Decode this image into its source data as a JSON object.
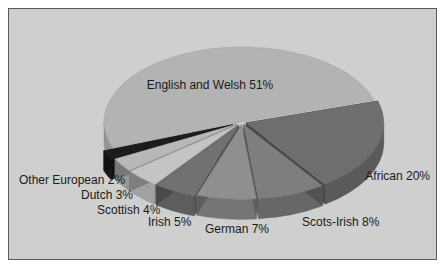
{
  "chart_data": {
    "type": "pie",
    "style": "3d-exploded",
    "title": "",
    "labels": [
      "English and Welsh",
      "African",
      "Scots-Irish",
      "German",
      "Irish",
      "Scottish",
      "Dutch",
      "Other European"
    ],
    "values": [
      51,
      20,
      8,
      7,
      5,
      4,
      3,
      2
    ],
    "display_labels": [
      "English and Welsh 51%",
      "African 20%",
      "Scots-Irish 8%",
      "German 7%",
      "Irish 5%",
      "Scottish 4%",
      "Dutch 3%",
      "Other European 2%"
    ],
    "units": "%",
    "legend": "none (direct labels)",
    "colors": [
      "#b3b3b3",
      "#6e6e6e",
      "#7e7e7e",
      "#8f8f8f",
      "#717171",
      "#c4c4c4",
      "#b8b8b8",
      "#1c1c1c"
    ]
  },
  "labels": {
    "english_welsh": "English and Welsh 51%",
    "african": "African 20%",
    "scots_irish": "Scots-Irish 8%",
    "german": "German 7%",
    "irish": "Irish 5%",
    "scottish": "Scottish 4%",
    "dutch": "Dutch 3%",
    "other_european": "Other European 2%"
  }
}
